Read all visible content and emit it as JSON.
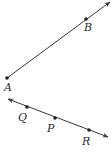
{
  "diagram": {
    "colors": {
      "stroke": "#3a3a3a",
      "point": "#222222",
      "label": "#2a2a2a"
    },
    "ray_AB": {
      "type": "ray",
      "points": [
        {
          "name": "A",
          "x": 7,
          "y": 78,
          "label_x": 4,
          "label_y": 91
        },
        {
          "name": "B",
          "x": 86,
          "y": 19,
          "label_x": 84,
          "label_y": 31
        }
      ],
      "arrow_tip": {
        "x": 110,
        "y": 2
      }
    },
    "line_QPR": {
      "type": "line",
      "points": [
        {
          "name": "Q",
          "x": 27,
          "y": 107,
          "label_x": 18,
          "label_y": 121
        },
        {
          "name": "P",
          "x": 55,
          "y": 118,
          "label_x": 47,
          "label_y": 132
        },
        {
          "name": "R",
          "x": 89,
          "y": 130,
          "label_x": 82,
          "label_y": 145
        }
      ],
      "arrow_tip_left": {
        "x": 8,
        "y": 99
      },
      "arrow_tip_right": {
        "x": 108,
        "y": 137
      }
    }
  }
}
